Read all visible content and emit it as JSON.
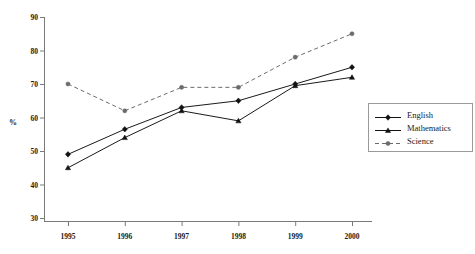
{
  "chart_data": {
    "type": "line",
    "title": "",
    "subtitle": "",
    "xlabel": "",
    "ylabel": "%",
    "categories": [
      "1995",
      "1996",
      "1997",
      "1998",
      "1999",
      "2000"
    ],
    "x": [
      1995,
      1996,
      1997,
      1998,
      1999,
      2000
    ],
    "ylim": [
      30,
      90
    ],
    "yticks": [
      30,
      40,
      50,
      60,
      70,
      80,
      90
    ],
    "ytick_labels": [
      "30",
      "40",
      "50",
      "60",
      "70",
      "80",
      "90"
    ],
    "grid": false,
    "legend_position": "right",
    "series": [
      {
        "name": "English",
        "values": [
          49,
          56.5,
          63,
          65,
          70,
          75
        ],
        "marker": "diamond",
        "line_style": "solid",
        "color": "#111111"
      },
      {
        "name": "Mathematics",
        "values": [
          45,
          54,
          62,
          59,
          69.5,
          72
        ],
        "marker": "triangle",
        "line_style": "solid",
        "color": "#111111"
      },
      {
        "name": "Science",
        "values": [
          70,
          62,
          69,
          69,
          78,
          85
        ],
        "marker": "circle",
        "line_style": "dashed",
        "color": "#6b6b6b"
      }
    ]
  },
  "legend": {
    "entries": [
      {
        "label": "English",
        "marker": "diamond-marker-icon",
        "style": "solid"
      },
      {
        "label": "Mathematics",
        "marker": "triangle-marker-icon",
        "style": "solid"
      },
      {
        "label": "Science",
        "marker": "circle-marker-icon",
        "style": "dashed"
      }
    ]
  },
  "axes": {
    "y_axis_label": "%",
    "y_tick_labels": [
      "90",
      "80",
      "70",
      "60",
      "50",
      "40",
      "30"
    ],
    "x_tick_labels": [
      "1995",
      "1996",
      "1997",
      "1998",
      "1999",
      "2000"
    ]
  }
}
